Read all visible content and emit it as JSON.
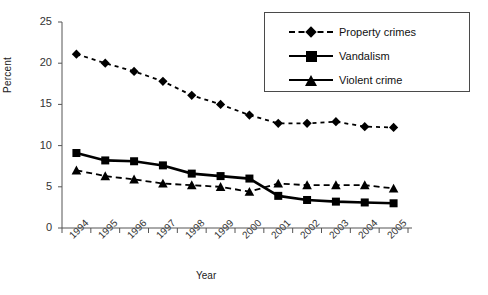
{
  "chart_data": {
    "type": "line",
    "title": "",
    "xlabel": "Year",
    "ylabel": "Percent",
    "categories": [
      "1994",
      "1995",
      "1996",
      "1997",
      "1998",
      "1999",
      "2000",
      "2001",
      "2002",
      "2003",
      "2004",
      "2005"
    ],
    "ylim": [
      0,
      25
    ],
    "yticks": [
      0,
      5,
      10,
      15,
      20,
      25
    ],
    "grid": false,
    "legend_position": "top-right",
    "series": [
      {
        "name": "Property crimes",
        "marker": "diamond",
        "linestyle": "dashed",
        "color": "#000000",
        "values": [
          21.1,
          20.0,
          19.0,
          17.8,
          16.1,
          15.0,
          13.7,
          12.7,
          12.7,
          12.9,
          12.3,
          12.2
        ]
      },
      {
        "name": "Vandalism",
        "marker": "square",
        "linestyle": "solid",
        "color": "#000000",
        "values": [
          9.1,
          8.2,
          8.1,
          7.6,
          6.6,
          6.3,
          6.0,
          3.9,
          3.4,
          3.2,
          3.1,
          3.0
        ]
      },
      {
        "name": "Violent crime",
        "marker": "triangle",
        "linestyle": "dashed",
        "color": "#000000",
        "values": [
          7.0,
          6.3,
          5.9,
          5.4,
          5.2,
          5.0,
          4.4,
          5.4,
          5.2,
          5.2,
          5.2,
          4.8
        ]
      }
    ]
  },
  "legend": {
    "items": [
      {
        "label": "Property crimes",
        "marker": "diamond",
        "linestyle": "dashed"
      },
      {
        "label": "Vandalism",
        "marker": "square",
        "linestyle": "solid"
      },
      {
        "label": "Violent crime",
        "marker": "triangle",
        "linestyle": "solid"
      }
    ]
  }
}
